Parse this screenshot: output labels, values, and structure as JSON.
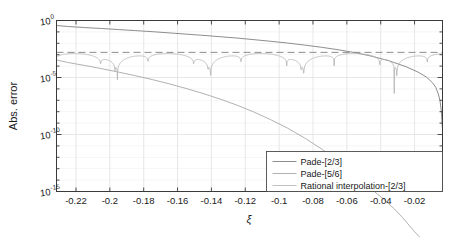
{
  "chart_data": {
    "type": "line",
    "title": "",
    "xlabel": "ξ",
    "ylabel": "Abs. error",
    "xlim": [
      -0.2315,
      -0.0035
    ],
    "ylim": [
      1e-15,
      1.0
    ],
    "yscale": "log",
    "xscale": "linear",
    "grid": true,
    "legend_position": "lower right",
    "xticks": [
      "-0.22",
      "-0.2",
      "-0.18",
      "-0.16",
      "-0.14",
      "-0.12",
      "-0.1",
      "-0.08",
      "-0.06",
      "-0.04",
      "-0.02"
    ],
    "xtick_values": [
      -0.22,
      -0.2,
      -0.18,
      -0.16,
      -0.14,
      -0.12,
      -0.1,
      -0.08,
      -0.06,
      -0.04,
      -0.02
    ],
    "yticks": [
      "10^0",
      "10^-5",
      "10^-10",
      "10^-15"
    ],
    "ytick_mantissa": [
      "10",
      "10",
      "10",
      "10"
    ],
    "ytick_exponents": [
      "0",
      "-5",
      "-10",
      "-15"
    ],
    "ytick_values": [
      1,
      1e-05,
      1e-10,
      1e-15
    ],
    "series": [
      {
        "name": "Pade-[2/3]",
        "color": "#808080",
        "style": "solid",
        "x": [
          -0.2315,
          -0.225,
          -0.215,
          -0.205,
          -0.195,
          -0.185,
          -0.175,
          -0.165,
          -0.155,
          -0.145,
          -0.135,
          -0.125,
          -0.115,
          -0.105,
          -0.095,
          -0.085,
          -0.075,
          -0.065,
          -0.055,
          -0.045,
          -0.035,
          -0.025,
          -0.018,
          -0.013,
          -0.0095,
          -0.0075,
          -0.006,
          -0.005,
          -0.0042,
          -0.0036
        ],
        "y": [
          0.36,
          0.3,
          0.24,
          0.2,
          0.16,
          0.13,
          0.105,
          0.082,
          0.064,
          0.05,
          0.038,
          0.029,
          0.021,
          0.015,
          0.0105,
          0.007,
          0.0045,
          0.0027,
          0.0015,
          0.00072,
          0.00029,
          8.8e-05,
          3e-05,
          1.1e-05,
          3.6e-06,
          1.4e-06,
          3.6e-07,
          1e-07,
          1.2e-08,
          4e-10
        ]
      },
      {
        "name": "Pade-[5/6]",
        "color": "#a8a8a8",
        "style": "solid",
        "x": [
          -0.2315,
          -0.225,
          -0.215,
          -0.205,
          -0.195,
          -0.185,
          -0.175,
          -0.165,
          -0.155,
          -0.145,
          -0.135,
          -0.125,
          -0.115,
          -0.105,
          -0.095,
          -0.085,
          -0.075,
          -0.065,
          -0.055,
          -0.045,
          -0.038,
          -0.032,
          -0.027,
          -0.023,
          -0.02,
          -0.017
        ],
        "y": [
          0.00035,
          0.00021,
          0.000115,
          6e-05,
          3e-05,
          1.45e-05,
          6.6e-06,
          2.8e-06,
          1.1e-06,
          4e-07,
          1.3e-07,
          3.8e-08,
          9.5e-09,
          2e-09,
          3.6e-10,
          5e-11,
          5.5e-12,
          4.2e-13,
          2e-14,
          1.4e-15,
          2e-16,
          3e-17,
          5e-18,
          1e-18,
          3e-19,
          1e-19
        ]
      },
      {
        "name": "Rational interpolation-[2/3]",
        "color": "#b8b8b8",
        "style": "oscillating",
        "envelope": 0.0016,
        "nodes": [
          -0.197,
          -0.1405,
          -0.0855,
          -0.0405,
          -0.0125
        ],
        "dip_depths": [
          3e-05,
          1.2e-05,
          2.5e-05,
          5e-05,
          0.0001
        ]
      }
    ],
    "reference_line": {
      "name": "equioscillation-level",
      "style": "dashed",
      "color": "#8c8c8c",
      "y": 0.0016
    }
  },
  "legend": {
    "items": [
      {
        "label": "Pade-[2/3]",
        "color": "#808080"
      },
      {
        "label": "Pade-[5/6]",
        "color": "#a8a8a8"
      },
      {
        "label": "Rational interpolation-[2/3]",
        "color": "#b8b8b8"
      }
    ]
  },
  "axes": {
    "x_label": "ξ",
    "y_label": "Abs. error"
  },
  "colors": {
    "axis": "#3a3a3a",
    "grid": "#dcdcdc",
    "text": "#1a1a1a",
    "background": "#ffffff"
  }
}
